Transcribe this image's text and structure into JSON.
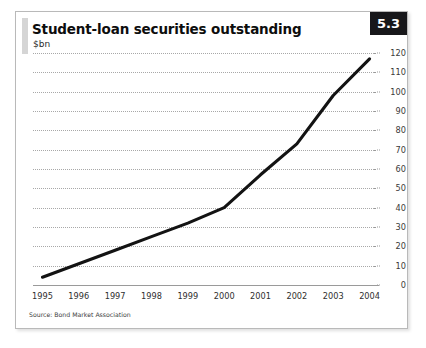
{
  "card": {
    "title": "Student-loan securities outstanding",
    "subtitle": "$bn",
    "badge": "5.3",
    "source": "Source: Bond Market Association"
  },
  "colors": {
    "badge_bg": "#17171a",
    "badge_text": "#ffffff",
    "line": "#131313",
    "grid": "#a8a8a8",
    "axis": "#9a9a9a",
    "card_border": "#b9b9b9",
    "accent_bar": "#d5d5d5"
  },
  "chart_data": {
    "type": "line",
    "title": "Student-loan securities outstanding",
    "subtitle": "$bn",
    "xlabel": "",
    "ylabel": "$bn",
    "categories": [
      "1995",
      "1996",
      "1997",
      "1998",
      "1999",
      "2000",
      "2001",
      "2002",
      "2003",
      "2004"
    ],
    "values": [
      4,
      11,
      18,
      25,
      32,
      40,
      57,
      73,
      98,
      117
    ],
    "series": [
      {
        "name": "Student-loan securities outstanding",
        "values": [
          4,
          11,
          18,
          25,
          32,
          40,
          57,
          73,
          98,
          117
        ]
      }
    ],
    "ylim": [
      0,
      120
    ],
    "ytick_values": [
      0,
      10,
      20,
      30,
      40,
      50,
      60,
      70,
      80,
      90,
      100,
      110,
      120
    ],
    "ytick_labels": [
      "0",
      "10",
      "20",
      "30",
      "40",
      "50",
      "60",
      "70",
      "80",
      "90",
      "100",
      "110",
      "120"
    ],
    "xtick_labels": [
      "1995",
      "1996",
      "1997",
      "1998",
      "1999",
      "2000",
      "2001",
      "2002",
      "2003",
      "2004"
    ],
    "grid": true,
    "grid_style": "dotted-horizontal",
    "legend": false,
    "legend_position": "none",
    "y_axis_side": "right",
    "annotations": [
      "Source: Bond Market Association"
    ]
  }
}
